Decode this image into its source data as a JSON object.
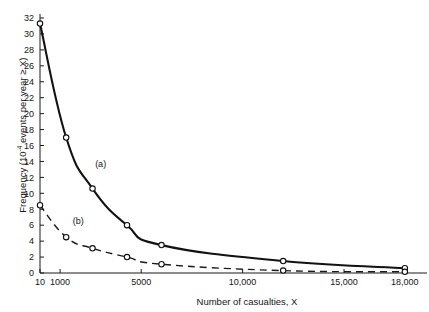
{
  "chart_data": {
    "type": "line",
    "title": "",
    "xlabel": "Number of casualties, X",
    "ylabel_parts": {
      "prefix": "Frequency (10",
      "exponent": "-4",
      "suffix": " events per year ≥ X)"
    },
    "ylabel": "Frequency (10-4 events per year ≥ X)",
    "xlim": [
      10,
      18500
    ],
    "ylim": [
      0,
      32
    ],
    "grid": false,
    "legend_position": "inline-annotations",
    "x_ticks": [
      {
        "value": 10,
        "label": "10"
      },
      {
        "value": 1000,
        "label": "1000"
      },
      {
        "value": 5000,
        "label": "5000"
      },
      {
        "value": 10000,
        "label": "10,000"
      },
      {
        "value": 15000,
        "label": "15,000"
      },
      {
        "value": 18000,
        "label": "18,000"
      }
    ],
    "y_ticks": [
      {
        "value": 0,
        "label": "0"
      },
      {
        "value": 2,
        "label": "2"
      },
      {
        "value": 4,
        "label": "4"
      },
      {
        "value": 6,
        "label": "6"
      },
      {
        "value": 8,
        "label": "8"
      },
      {
        "value": 10,
        "label": "10"
      },
      {
        "value": 12,
        "label": "12"
      },
      {
        "value": 14,
        "label": "14"
      },
      {
        "value": 16,
        "label": "16"
      },
      {
        "value": 18,
        "label": "18"
      },
      {
        "value": 20,
        "label": "20"
      },
      {
        "value": 22,
        "label": "22"
      },
      {
        "value": 24,
        "label": "24"
      },
      {
        "value": 26,
        "label": "26"
      },
      {
        "value": 28,
        "label": "28"
      },
      {
        "value": 30,
        "label": "30"
      },
      {
        "value": 32,
        "label": "32"
      }
    ],
    "series": [
      {
        "name": "(a)",
        "style": "solid",
        "label_x": 3000,
        "label_y": 13.3,
        "points": [
          {
            "x": 10,
            "y": 31.3
          },
          {
            "x": 1300,
            "y": 17.0
          },
          {
            "x": 2600,
            "y": 10.6
          },
          {
            "x": 4300,
            "y": 6.0
          },
          {
            "x": 6000,
            "y": 3.5
          },
          {
            "x": 12000,
            "y": 1.5
          },
          {
            "x": 18000,
            "y": 0.6
          }
        ]
      },
      {
        "name": "(b)",
        "style": "dashed",
        "label_x": 1900,
        "label_y": 6.1,
        "points": [
          {
            "x": 10,
            "y": 8.5
          },
          {
            "x": 1300,
            "y": 4.5
          },
          {
            "x": 2600,
            "y": 3.1
          },
          {
            "x": 4300,
            "y": 2.0
          },
          {
            "x": 6000,
            "y": 1.1
          },
          {
            "x": 12000,
            "y": 0.3
          },
          {
            "x": 18000,
            "y": 0.15
          }
        ]
      }
    ]
  }
}
